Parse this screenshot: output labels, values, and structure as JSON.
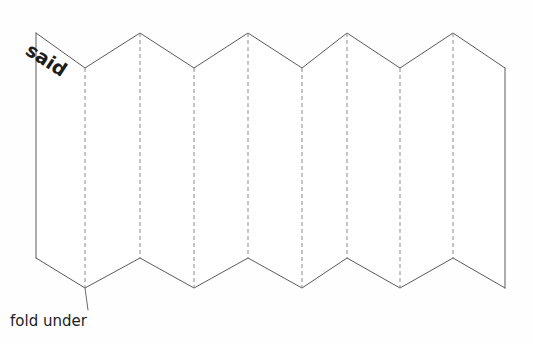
{
  "diagram": {
    "background_color": "#fefefe",
    "solid_edge_color": "#5a5a5a",
    "fold_line_color": "#8a8a8a",
    "leader_line_color": "#6a6a6a",
    "text_color": "#1d1d1d",
    "labels": {
      "said": "said",
      "fold_under": "fold under"
    },
    "said_rotation_degrees": 33,
    "geometry": {
      "left_edge_x": 36,
      "right_edge_x": 505,
      "top_peak_y": 33,
      "top_valley_y": 68,
      "bottom_peak_y": 258,
      "bottom_valley_y": 288,
      "fold_line_x_positions": [
        85,
        140,
        194,
        248,
        302,
        347,
        400,
        453
      ],
      "top_vertices": [
        [
          36,
          33
        ],
        [
          85,
          68
        ],
        [
          140,
          33
        ],
        [
          194,
          68
        ],
        [
          248,
          33
        ],
        [
          302,
          68
        ],
        [
          347,
          33
        ],
        [
          400,
          68
        ],
        [
          453,
          33
        ],
        [
          505,
          68
        ]
      ],
      "bottom_vertices": [
        [
          36,
          258
        ],
        [
          85,
          288
        ],
        [
          140,
          258
        ],
        [
          194,
          288
        ],
        [
          248,
          258
        ],
        [
          302,
          288
        ],
        [
          347,
          258
        ],
        [
          400,
          288
        ],
        [
          453,
          258
        ],
        [
          505,
          288
        ]
      ],
      "leader_line": {
        "from": [
          88,
          310
        ],
        "to": [
          85,
          288
        ]
      },
      "panel_count": 9
    }
  }
}
